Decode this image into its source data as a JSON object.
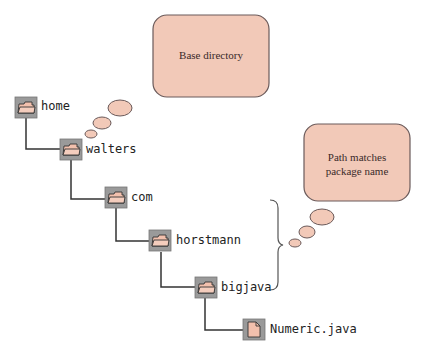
{
  "tree": {
    "nodes": [
      {
        "label": "home",
        "icon": "folder-icon"
      },
      {
        "label": "walters",
        "icon": "folder-icon"
      },
      {
        "label": "com",
        "icon": "folder-icon"
      },
      {
        "label": "horstmann",
        "icon": "folder-icon"
      },
      {
        "label": "bigjava",
        "icon": "folder-icon"
      },
      {
        "label": "Numeric.java",
        "icon": "file-icon"
      }
    ]
  },
  "callouts": {
    "base": {
      "text": "Base directory"
    },
    "package": {
      "line1": "Path matches",
      "line2": "package name"
    }
  },
  "colors": {
    "bubble_fill": "#f2c9b8",
    "bubble_stroke": "#6a5a5a",
    "icon_bg": "#9a9a9a",
    "folder_fill": "#f2c0ad",
    "line": "#333333"
  }
}
